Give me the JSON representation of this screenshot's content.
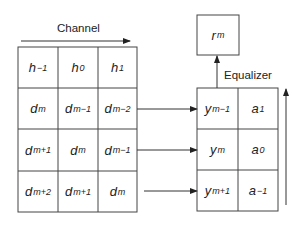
{
  "diagram": {
    "channel_label": "Channel",
    "equalizer_label": "Equalizer",
    "output": {
      "base": "r",
      "sub": "m"
    },
    "channel_grid": [
      [
        {
          "base": "h",
          "sub": "−1"
        },
        {
          "base": "h",
          "sub": "0"
        },
        {
          "base": "h",
          "sub": "1"
        }
      ],
      [
        {
          "base": "d",
          "sub": "m"
        },
        {
          "base": "d",
          "sub": "m−1"
        },
        {
          "base": "d",
          "sub": "m−2"
        }
      ],
      [
        {
          "base": "d",
          "sub": "m+1"
        },
        {
          "base": "d",
          "sub": "m"
        },
        {
          "base": "d",
          "sub": "m−1"
        }
      ],
      [
        {
          "base": "d",
          "sub": "m+2"
        },
        {
          "base": "d",
          "sub": "m+1"
        },
        {
          "base": "d",
          "sub": "m"
        }
      ]
    ],
    "equalizer_grid": [
      [
        {
          "base": "y",
          "sub": "m−1"
        },
        {
          "base": "a",
          "sub": "1"
        }
      ],
      [
        {
          "base": "y",
          "sub": "m"
        },
        {
          "base": "a",
          "sub": "0"
        }
      ],
      [
        {
          "base": "y",
          "sub": "m+1"
        },
        {
          "base": "a",
          "sub": "−1"
        }
      ]
    ],
    "line_color": "#333333"
  }
}
